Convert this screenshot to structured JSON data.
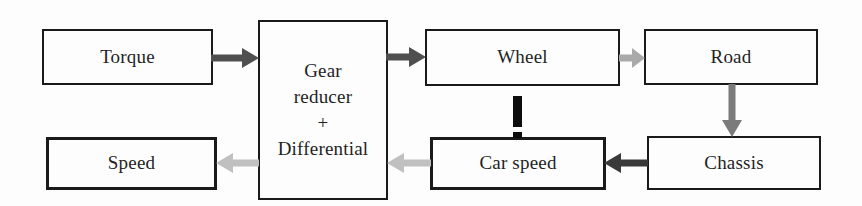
{
  "page": {
    "background": "#fdfdfd",
    "border_color": "#1a1a1a",
    "text_color": "#1f1f1f"
  },
  "diagram": {
    "type": "block-diagram",
    "boxes": {
      "torque": {
        "label": "Torque"
      },
      "gear_reducer": {
        "label": "Gear\nreducer\n+\nDifferential"
      },
      "wheel": {
        "label": "Wheel"
      },
      "road": {
        "label": "Road"
      },
      "speed": {
        "label": "Speed"
      },
      "car_speed": {
        "label": "Car speed"
      },
      "chassis": {
        "label": "Chassis"
      }
    },
    "connections": [
      {
        "from": "Torque",
        "to": "Gear reducer + Differential",
        "direction": "right",
        "style": "solid-arrow",
        "color": "#4f4f4f"
      },
      {
        "from": "Gear reducer + Differential",
        "to": "Wheel",
        "direction": "right",
        "style": "solid-arrow",
        "color": "#4f4f4f"
      },
      {
        "from": "Wheel",
        "to": "Road",
        "direction": "right",
        "style": "solid-arrow",
        "color": "#a9a9a9"
      },
      {
        "from": "Road",
        "to": "Chassis",
        "direction": "down",
        "style": "solid-arrow",
        "color": "#7b7b7b"
      },
      {
        "from": "Chassis",
        "to": "Car speed",
        "direction": "left",
        "style": "solid-arrow",
        "color": "#3a3a3a"
      },
      {
        "from": "Car speed",
        "to": "Gear reducer + Differential",
        "direction": "left",
        "style": "solid-arrow",
        "color": "#c0c0c0"
      },
      {
        "from": "Gear reducer + Differential",
        "to": "Speed",
        "direction": "left",
        "style": "solid-arrow",
        "color": "#c0c0c0"
      },
      {
        "from": "Wheel",
        "to": "Car speed",
        "direction": "down",
        "style": "dashed-line",
        "color": "#0d0d0d"
      }
    ]
  }
}
